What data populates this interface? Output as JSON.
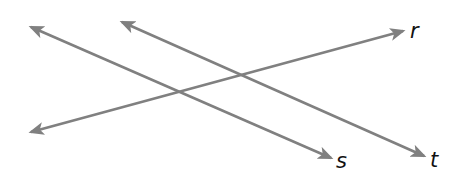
{
  "diagram": {
    "type": "lines-and-transversal",
    "stroke_color": "#808080",
    "label_color": "#111111",
    "background": "#ffffff",
    "lines": [
      {
        "id": "s",
        "label": "s",
        "x1": 31,
        "y1": 27,
        "x2": 331,
        "y2": 158,
        "label_x": 336,
        "label_y": 168
      },
      {
        "id": "t",
        "label": "t",
        "x1": 122,
        "y1": 22,
        "x2": 424,
        "y2": 156,
        "label_x": 430,
        "label_y": 167
      },
      {
        "id": "r",
        "label": "r",
        "x1": 31,
        "y1": 132,
        "x2": 403,
        "y2": 31,
        "label_x": 410,
        "label_y": 38
      }
    ]
  }
}
